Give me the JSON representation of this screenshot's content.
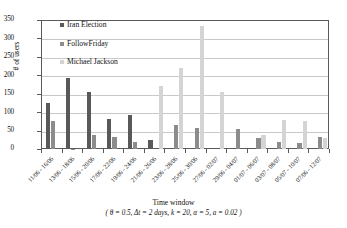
{
  "chart_data": {
    "type": "bar",
    "title": "",
    "xlabel": "Time window",
    "xlabel_sub": "( θ = 0.5,  Δt = 2 days,  k = 20,  α = 5,  a = 0.02 )",
    "ylabel": "# of users",
    "ylim": [
      0,
      350
    ],
    "yticks": [
      0,
      50,
      100,
      150,
      200,
      250,
      300,
      350
    ],
    "grid": true,
    "legend_position": "inside-top-left",
    "categories": [
      "11/06 - 16/06",
      "13/06 - 18/06",
      "15/06 - 20/06",
      "17/06 - 22/06",
      "19/06 - 24/06",
      "21/06 - 26/06",
      "23/06 - 28/06",
      "25/06 - 30/06",
      "27/06 - 02/07",
      "29/06 - 04/07",
      "01/07 - 06/07",
      "03/07 - 08/07",
      "05/07 - 10/07",
      "07/06 - 12/07"
    ],
    "series": [
      {
        "name": "Iran Election",
        "color": "#595959",
        "values": [
          125,
          193,
          156,
          82,
          92,
          24,
          0,
          0,
          0,
          0,
          0,
          0,
          0,
          0
        ]
      },
      {
        "name": "FollowFriday",
        "color": "#8c8c8c",
        "values": [
          76,
          1,
          38,
          32,
          19,
          0,
          66,
          57,
          0,
          53,
          30,
          20,
          17,
          33
        ]
      },
      {
        "name": "Michael Jackson",
        "color": "#d4d4d4",
        "values": [
          0,
          0,
          0,
          0,
          0,
          171,
          221,
          335,
          156,
          0,
          38,
          78,
          77,
          31
        ]
      }
    ]
  }
}
